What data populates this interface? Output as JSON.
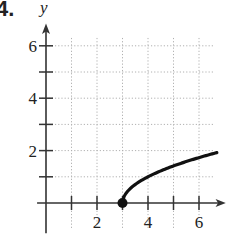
{
  "problem_number": "4.",
  "chart_data": {
    "type": "line",
    "title": "",
    "xlabel": "",
    "ylabel": "y",
    "function": "y = sqrt(x - 3)",
    "x": [
      3,
      3.25,
      3.5,
      4,
      4.5,
      5,
      5.5,
      6,
      6.5,
      6.7
    ],
    "values": [
      0,
      0.5,
      0.71,
      1,
      1.22,
      1.41,
      1.58,
      1.73,
      1.87,
      1.92
    ],
    "endpoint": {
      "x": 3,
      "y": 0,
      "filled": true
    },
    "xlim": [
      -0.3,
      7
    ],
    "ylim": [
      -1.2,
      6.9
    ],
    "x_ticks": [
      1,
      2,
      3,
      4,
      5,
      6
    ],
    "x_tick_labels": {
      "2": "2",
      "4": "4",
      "6": "6"
    },
    "y_ticks": [
      1,
      2,
      3,
      4,
      5,
      6
    ],
    "y_tick_labels": {
      "2": "2",
      "4": "4",
      "6": "6"
    },
    "grid": true,
    "grid_style": "dotted"
  },
  "colors": {
    "curve": "#111111",
    "axis": "#333333",
    "grid": "#b0b0b0"
  }
}
